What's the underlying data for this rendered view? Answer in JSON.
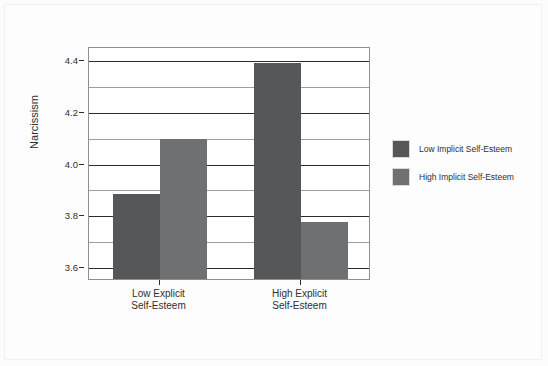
{
  "chart_data": {
    "type": "bar",
    "title": "",
    "xlabel": "",
    "ylabel": "Narcissism",
    "ylim": [
      3.55,
      4.45
    ],
    "yticks": [
      "3.6",
      "3.8",
      "4.0",
      "4.2",
      "4.4"
    ],
    "ytick_values": [
      3.6,
      3.8,
      4.0,
      4.2,
      4.4
    ],
    "minor_gridlines": [
      3.7,
      3.9,
      4.1,
      4.3
    ],
    "grid": true,
    "legend_position": "right",
    "categories": [
      "Low Explicit\nSelf-Esteem",
      "High Explicit\nSelf-Esteem"
    ],
    "category_lines": [
      {
        "line1": "Low Explicit",
        "line2": "Self-Esteem"
      },
      {
        "line1": "High Explicit",
        "line2": "Self-Esteem"
      }
    ],
    "series": [
      {
        "name": "Low Implicit Self-Esteem",
        "color": "#555759",
        "values": [
          3.88,
          4.385
        ]
      },
      {
        "name": "High Implicit Self-Esteem",
        "color": "#6e7072",
        "values": [
          4.09,
          3.77
        ]
      }
    ]
  },
  "axes": {
    "y_title": "Narcissism"
  },
  "legend": {
    "entries": [
      {
        "label": "Low Implicit Self-Esteem",
        "color": "#555759"
      },
      {
        "label": "High Implicit Self-Esteem",
        "color": "#6e7072"
      }
    ]
  }
}
